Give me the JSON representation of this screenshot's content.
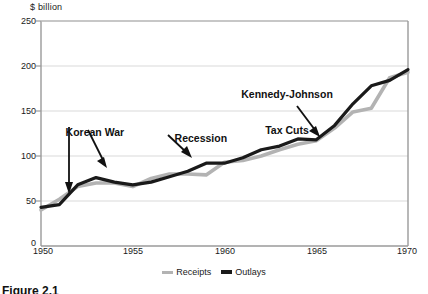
{
  "chart_data": {
    "type": "line",
    "title": "",
    "axis_title": "$  billion",
    "xlabel": "",
    "ylabel": "$ billion",
    "xlim": [
      1950,
      1970
    ],
    "ylim": [
      0,
      250
    ],
    "yticks": [
      250,
      200,
      150,
      100,
      50,
      0
    ],
    "xticks": [
      1950,
      1955,
      1960,
      1965,
      1970
    ],
    "grid": "horizontal",
    "legend_position": "bottom-center",
    "x": [
      1950,
      1951,
      1952,
      1953,
      1954,
      1955,
      1956,
      1957,
      1958,
      1959,
      1960,
      1961,
      1962,
      1963,
      1964,
      1965,
      1966,
      1967,
      1968,
      1969,
      1970
    ],
    "series": [
      {
        "name": "Receipts",
        "color": "#b3b3b3",
        "values": [
          40,
          52,
          66,
          70,
          70,
          66,
          75,
          80,
          80,
          79,
          93,
          95,
          100,
          107,
          113,
          117,
          131,
          149,
          153,
          187,
          193
        ]
      },
      {
        "name": "Outlays",
        "color": "#1a1a1a",
        "values": [
          43,
          46,
          68,
          76,
          71,
          68,
          71,
          77,
          83,
          92,
          92,
          98,
          107,
          111,
          119,
          118,
          134,
          158,
          178,
          184,
          196
        ]
      }
    ],
    "annotations": [
      {
        "id": "korean-war",
        "text": "Korean War",
        "line1": "Korean War",
        "line2": ""
      },
      {
        "id": "recession",
        "text": "Recession",
        "line1": "Recession",
        "line2": ""
      },
      {
        "id": "kennedy-johnson-tax-cuts",
        "text": "Kennedy-Johnson Tax Cuts",
        "line1": "Kennedy-Johnson",
        "line2": "Tax Cuts"
      }
    ]
  },
  "legend": {
    "items": [
      {
        "label": "Receipts",
        "color": "#b3b3b3"
      },
      {
        "label": "Outlays",
        "color": "#1a1a1a"
      }
    ]
  },
  "caption": {
    "text": "Figure 2.1"
  },
  "colors": {
    "receipts": "#b3b3b3",
    "outlays": "#1a1a1a",
    "grid": "#d9d9d9",
    "frame": "#9a9a9a",
    "text": "#1a1a1a"
  }
}
